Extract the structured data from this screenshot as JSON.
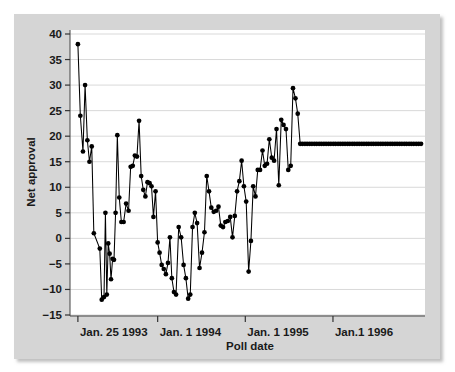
{
  "figure": {
    "background_color": "#d5d5d5",
    "plot_background_color": "#ffffff",
    "grid_color": "#d9d9d9",
    "axis_color": "#000000",
    "series_color": "#000000"
  },
  "chart_data": {
    "type": "line",
    "title": "",
    "subtitle": "",
    "xlabel": "Poll date",
    "ylabel": "Net approval",
    "ylim": [
      -15,
      40
    ],
    "yticks": [
      -15,
      -10,
      -5,
      0,
      5,
      10,
      15,
      20,
      25,
      30,
      35,
      40
    ],
    "ytick_labels": [
      "−15",
      "−10",
      "−5",
      "0",
      "5",
      "10",
      "15",
      "20",
      "25",
      "30",
      "35",
      "40"
    ],
    "xlim": [
      0,
      4.05
    ],
    "xticks": [
      0.09,
      1.0,
      2.0,
      3.0
    ],
    "xtick_labels": [
      "Jan. 25 1993",
      "Jan. 1 1994",
      "Jan. 1 1995",
      "Jan.1 1996"
    ],
    "grid": "horizontal",
    "legend": "none",
    "markers": "filled-circle",
    "series": [
      {
        "name": "Net approval",
        "x": [
          0.09,
          0.118,
          0.148,
          0.172,
          0.198,
          0.222,
          0.248,
          0.272,
          0.34,
          0.362,
          0.388,
          0.404,
          0.42,
          0.436,
          0.452,
          0.468,
          0.486,
          0.502,
          0.52,
          0.54,
          0.562,
          0.586,
          0.612,
          0.64,
          0.668,
          0.692,
          0.716,
          0.74,
          0.764,
          0.788,
          0.812,
          0.836,
          0.86,
          0.884,
          0.908,
          0.93,
          0.952,
          0.976,
          1.0,
          1.022,
          1.046,
          1.07,
          1.094,
          1.118,
          1.14,
          1.162,
          1.186,
          1.21,
          1.24,
          1.268,
          1.296,
          1.322,
          1.348,
          1.372,
          1.398,
          1.424,
          1.45,
          1.478,
          1.506,
          1.534,
          1.56,
          1.586,
          1.612,
          1.64,
          1.668,
          1.694,
          1.72,
          1.746,
          1.772,
          1.8,
          1.828,
          1.854,
          1.88,
          1.906,
          1.932,
          1.958,
          1.984,
          2.01,
          2.038,
          2.064,
          2.09,
          2.116,
          2.142,
          2.168,
          2.196,
          2.222,
          2.248,
          2.274,
          2.302,
          2.328,
          2.356,
          2.382,
          2.41,
          2.436,
          2.464,
          2.49,
          2.518,
          2.544,
          2.572,
          2.598,
          2.626,
          2.652,
          2.68,
          2.706,
          2.734,
          2.76,
          2.788,
          2.814,
          2.842,
          2.868,
          2.896,
          2.922,
          2.95,
          2.976,
          3.004,
          3.03,
          3.058,
          3.084,
          3.112,
          3.138,
          3.166,
          3.192,
          3.22,
          3.246,
          3.274,
          3.3,
          3.328,
          3.354,
          3.382,
          3.408,
          3.436,
          3.462,
          3.49,
          3.516,
          3.544,
          3.57,
          3.598,
          3.624,
          3.652,
          3.678,
          3.706,
          3.732,
          3.76,
          3.786,
          3.814,
          3.84,
          3.868,
          3.894,
          3.922,
          3.95,
          3.978,
          4.005
        ],
        "values": [
          38.0,
          24.0,
          17.0,
          30.0,
          19.2,
          15.0,
          18.0,
          1.0,
          -2.0,
          -12.0,
          -11.5,
          5.0,
          -11.0,
          -1.0,
          -3.0,
          -8.0,
          -4.0,
          -4.2,
          5.0,
          20.2,
          8.0,
          3.2,
          3.2,
          6.8,
          5.4,
          14.0,
          14.2,
          16.2,
          16.0,
          23.0,
          12.2,
          9.5,
          8.2,
          11.0,
          10.8,
          10.2,
          4.2,
          9.2,
          -0.8,
          -2.8,
          -5.2,
          -6.0,
          -7.0,
          -4.8,
          0.2,
          -7.8,
          -10.5,
          -11.0,
          2.2,
          0.2,
          -5.2,
          -7.8,
          -11.8,
          -11.0,
          2.2,
          5.0,
          3.0,
          -5.8,
          -2.8,
          1.2,
          12.2,
          9.2,
          6.0,
          5.2,
          5.4,
          6.2,
          2.5,
          2.2,
          3.2,
          3.4,
          4.2,
          0.2,
          4.4,
          9.2,
          11.2,
          15.2,
          10.2,
          7.2,
          -6.5,
          -0.5,
          10.2,
          8.2,
          13.4,
          13.4,
          17.2,
          14.2,
          14.6,
          19.4,
          15.8,
          15.2,
          21.4,
          10.4,
          23.2,
          22.2,
          21.4,
          13.4,
          14.2,
          29.4,
          27.4,
          24.4,
          18.5,
          18.5,
          18.5,
          18.5,
          18.5,
          18.5,
          18.5,
          18.5,
          18.5,
          18.5,
          18.5,
          18.5,
          18.5,
          18.5,
          18.5,
          18.5,
          18.5,
          18.5,
          18.5,
          18.5,
          18.5,
          18.5,
          18.5,
          18.5,
          18.5,
          18.5,
          18.5,
          18.5,
          18.5,
          18.5,
          18.5,
          18.5,
          18.5,
          18.5,
          18.5,
          18.5,
          18.5,
          18.5,
          18.5,
          18.5,
          18.5,
          18.5,
          18.5,
          18.5,
          18.5,
          18.5,
          18.5,
          18.5,
          18.5,
          18.5,
          18.5,
          18.5
        ]
      }
    ]
  }
}
